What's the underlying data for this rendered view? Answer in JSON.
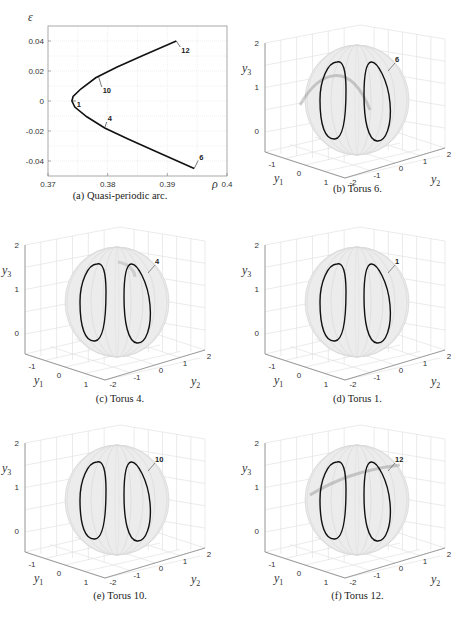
{
  "figure": {
    "panels": [
      {
        "id": "a",
        "caption": "(a) Quasi-periodic arc."
      },
      {
        "id": "b",
        "caption": "(b) Torus 6.",
        "label": "6"
      },
      {
        "id": "c",
        "caption": "(c) Torus 4.",
        "label": "4"
      },
      {
        "id": "d",
        "caption": "(d) Torus 1.",
        "label": "1"
      },
      {
        "id": "e",
        "caption": "(e) Torus 10.",
        "label": "10"
      },
      {
        "id": "f",
        "caption": "(f) Torus 12.",
        "label": "12"
      }
    ],
    "axes3d": {
      "y1_label": "y1",
      "y2_label": "y2",
      "y3_label": "y3",
      "y1_ticks": [
        "-1",
        "0",
        "1"
      ],
      "y2_ticks": [
        "-2",
        "-1",
        "0",
        "1",
        "2"
      ],
      "y3_ticks": [
        "0",
        "1",
        "2"
      ]
    }
  },
  "chart_data": [
    {
      "type": "line",
      "title": "(a) Quasi-periodic arc.",
      "xlabel": "ρ",
      "ylabel": "ε",
      "xlim": [
        0.37,
        0.4
      ],
      "ylim": [
        -0.05,
        0.05
      ],
      "xticks": [
        "0.37",
        "0.38",
        "0.39",
        "0.4"
      ],
      "yticks": [
        "-0.04",
        "-0.02",
        "0",
        "0.02",
        "0.04"
      ],
      "grid": true,
      "series": [
        {
          "name": "quasi-periodic arc",
          "x": [
            0.3915,
            0.386,
            0.3815,
            0.378,
            0.3755,
            0.3742,
            0.374,
            0.3745,
            0.3765,
            0.3795,
            0.3835,
            0.388,
            0.3945
          ],
          "y": [
            0.04,
            0.0305,
            0.0225,
            0.0155,
            0.008,
            0.003,
            0.0,
            -0.004,
            -0.0105,
            -0.018,
            -0.0255,
            -0.0335,
            -0.045
          ]
        }
      ],
      "annotations": [
        {
          "text": "12",
          "x": 0.3915,
          "y": 0.04
        },
        {
          "text": "10",
          "x": 0.3785,
          "y": 0.016
        },
        {
          "text": "1",
          "x": 0.374,
          "y": 0.0
        },
        {
          "text": "4",
          "x": 0.3795,
          "y": -0.018
        },
        {
          "text": "6",
          "x": 0.3945,
          "y": -0.045
        }
      ]
    },
    {
      "type": "scatter",
      "title": "(b) Torus 6.",
      "xlabel": "y1",
      "ylabel": "y2",
      "zlabel": "y3",
      "annotations": [
        {
          "text": "6"
        }
      ]
    },
    {
      "type": "scatter",
      "title": "(c) Torus 4.",
      "xlabel": "y1",
      "ylabel": "y2",
      "zlabel": "y3",
      "annotations": [
        {
          "text": "4"
        }
      ]
    },
    {
      "type": "scatter",
      "title": "(d) Torus 1.",
      "xlabel": "y1",
      "ylabel": "y2",
      "zlabel": "y3",
      "annotations": [
        {
          "text": "1"
        }
      ]
    },
    {
      "type": "scatter",
      "title": "(e) Torus 10.",
      "xlabel": "y1",
      "ylabel": "y2",
      "zlabel": "y3",
      "annotations": [
        {
          "text": "10"
        }
      ]
    },
    {
      "type": "scatter",
      "title": "(f) Torus 12.",
      "xlabel": "y1",
      "ylabel": "y2",
      "zlabel": "y3",
      "annotations": [
        {
          "text": "12"
        }
      ]
    }
  ]
}
